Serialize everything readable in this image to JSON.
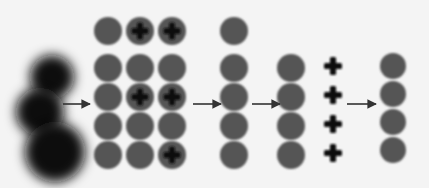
{
  "diagram": {
    "colors": {
      "background": "#f4f4f4",
      "circle_fill": "#555555",
      "blob_fill": "#111111",
      "plus_color": "#111111",
      "arrow_color": "#333333"
    },
    "stages": [
      {
        "id": "blurred-blobs",
        "blobs": [
          {
            "cx": 52,
            "cy": 77,
            "r": 22
          },
          {
            "cx": 40,
            "cy": 112,
            "r": 24
          },
          {
            "cx": 55,
            "cy": 152,
            "r": 30
          }
        ]
      },
      {
        "id": "circle-grid",
        "columns_x": [
          108,
          140,
          172
        ],
        "rows_y": [
          31,
          68,
          97,
          126,
          155
        ],
        "radius": 14,
        "plus_marks": [
          [
            0,
            1
          ],
          [
            0,
            2
          ],
          [
            2,
            1
          ],
          [
            2,
            2
          ],
          [
            4,
            2
          ]
        ]
      },
      {
        "id": "single-column",
        "x": 234,
        "rows_y": [
          31,
          68,
          97,
          126,
          155
        ],
        "radius": 14
      },
      {
        "id": "separated-column",
        "x": 291,
        "rows_y": [
          68,
          97,
          126,
          155
        ],
        "radius": 14,
        "plus_x": 333,
        "plus_rows_y": [
          66,
          95,
          124,
          153
        ]
      },
      {
        "id": "final-column",
        "x": 393,
        "rows_y": [
          66,
          94,
          122,
          150
        ],
        "radius": 13
      }
    ],
    "arrows": [
      {
        "x1": 63,
        "x2": 90,
        "y": 104
      },
      {
        "x1": 193,
        "x2": 221,
        "y": 104
      },
      {
        "x1": 252,
        "x2": 280,
        "y": 104
      },
      {
        "x1": 347,
        "x2": 376,
        "y": 104
      }
    ]
  }
}
